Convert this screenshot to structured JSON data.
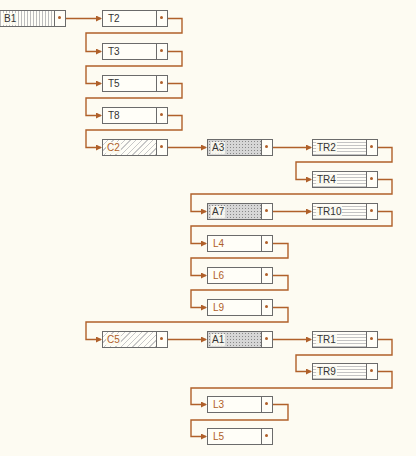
{
  "diagram": {
    "type": "linked-list-structure",
    "connector_color": "#b0602a",
    "nodes": [
      {
        "id": "B1",
        "label": "B1",
        "kind": "b"
      },
      {
        "id": "T2",
        "label": "T2",
        "kind": "t"
      },
      {
        "id": "T3",
        "label": "T3",
        "kind": "t"
      },
      {
        "id": "T5",
        "label": "T5",
        "kind": "t"
      },
      {
        "id": "T8",
        "label": "T8",
        "kind": "t"
      },
      {
        "id": "C2",
        "label": "C2",
        "kind": "c"
      },
      {
        "id": "A3",
        "label": "A3",
        "kind": "a"
      },
      {
        "id": "TR2",
        "label": "TR2",
        "kind": "tr"
      },
      {
        "id": "TR4",
        "label": "TR4",
        "kind": "tr"
      },
      {
        "id": "A7",
        "label": "A7",
        "kind": "a"
      },
      {
        "id": "TR10",
        "label": "TR10",
        "kind": "tr"
      },
      {
        "id": "L4",
        "label": "L4",
        "kind": "l"
      },
      {
        "id": "L6",
        "label": "L6",
        "kind": "l"
      },
      {
        "id": "L9",
        "label": "L9",
        "kind": "l"
      },
      {
        "id": "C5",
        "label": "C5",
        "kind": "c"
      },
      {
        "id": "A1",
        "label": "A1",
        "kind": "a"
      },
      {
        "id": "TR1",
        "label": "TR1",
        "kind": "tr"
      },
      {
        "id": "TR9",
        "label": "TR9",
        "kind": "tr"
      },
      {
        "id": "L3",
        "label": "L3",
        "kind": "l"
      },
      {
        "id": "L5",
        "label": "L5",
        "kind": "l"
      }
    ],
    "links": [
      [
        "B1",
        "T2"
      ],
      [
        "T2",
        "T3"
      ],
      [
        "T3",
        "T5"
      ],
      [
        "T5",
        "T8"
      ],
      [
        "T8",
        "C2"
      ],
      [
        "C2",
        "A3"
      ],
      [
        "A3",
        "TR2"
      ],
      [
        "TR2",
        "TR4"
      ],
      [
        "TR4",
        "A7"
      ],
      [
        "A7",
        "TR10"
      ],
      [
        "TR10",
        "L4"
      ],
      [
        "L4",
        "L6"
      ],
      [
        "L6",
        "L9"
      ],
      [
        "L9",
        "C5"
      ],
      [
        "C5",
        "A1"
      ],
      [
        "A1",
        "TR1"
      ],
      [
        "TR1",
        "TR9"
      ],
      [
        "TR9",
        "L3"
      ],
      [
        "L3",
        "L5"
      ]
    ]
  }
}
